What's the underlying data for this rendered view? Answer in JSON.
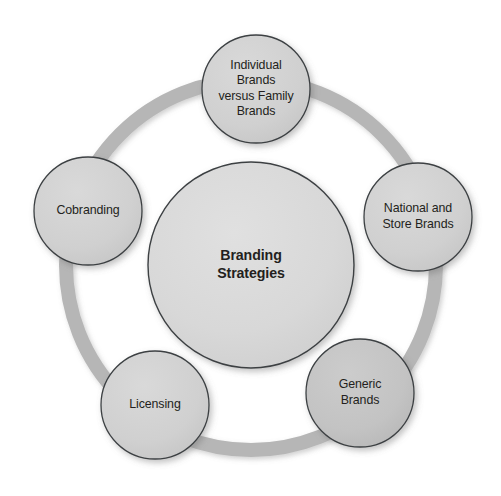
{
  "diagram": {
    "title": "Branding Strategies",
    "type": "cycle-hub-and-spoke",
    "canvas": {
      "width": 501,
      "height": 496,
      "background": "#ffffff"
    },
    "ring": {
      "name": "connector-ring",
      "center_x": 251,
      "center_y": 265,
      "radius": 185,
      "stroke_width": 14,
      "color": "#b6b6b6"
    },
    "center_node": {
      "label": "Branding\nStrategies",
      "cx": 251,
      "cy": 265,
      "r": 103,
      "fill": "#d7d7d7",
      "stroke": "#3c4043",
      "text_color": "#231f20"
    },
    "outer_nodes": [
      {
        "id": "individual-brands-versus-family-brands",
        "label": "Individual\nBrands\nversus Family\nBrands",
        "cx": 256,
        "cy": 89,
        "r": 54,
        "fill": "#cfcfcf",
        "stroke": "#3c4043",
        "text_color": "#231f20"
      },
      {
        "id": "national-and-store-brands",
        "label": "National and\nStore Brands",
        "cx": 418,
        "cy": 217,
        "r": 54,
        "fill": "#cfcfcf",
        "stroke": "#3c4043",
        "text_color": "#231f20"
      },
      {
        "id": "generic-brands",
        "label": "Generic\nBrands",
        "cx": 360,
        "cy": 393,
        "r": 54,
        "fill": "#c2c2c2",
        "stroke": "#3c4043",
        "text_color": "#231f20"
      },
      {
        "id": "licensing",
        "label": "Licensing",
        "cx": 155,
        "cy": 405,
        "r": 54,
        "fill": "#cfcfcf",
        "stroke": "#3c4043",
        "text_color": "#231f20"
      },
      {
        "id": "cobranding",
        "label": "Cobranding",
        "cx": 88,
        "cy": 211,
        "r": 54,
        "fill": "#cfcfcf",
        "stroke": "#3c4043",
        "text_color": "#231f20"
      }
    ]
  }
}
